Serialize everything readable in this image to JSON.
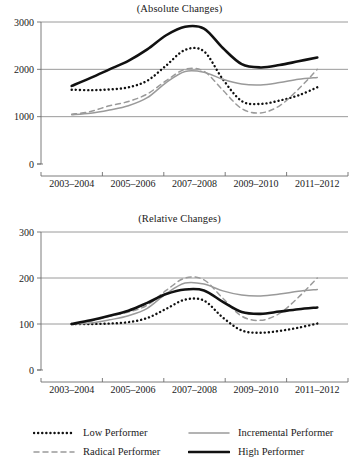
{
  "chart_data": [
    {
      "type": "line",
      "title": "(Absolute Changes)",
      "xlabel": "",
      "ylabel": "",
      "x": [
        "2003–2004",
        "2005–2006",
        "2007–2008",
        "2009–2010",
        "2011–2012"
      ],
      "xticklabels": [
        "2003–2004",
        "2005–2006",
        "2007–2008",
        "2009–2010",
        "2011–2012"
      ],
      "yticklabels": [
        "0",
        "1000",
        "2000",
        "3000"
      ],
      "ylim": [
        0,
        3000
      ],
      "yticks": [
        0,
        1000,
        2000,
        3000
      ],
      "grid": true,
      "legend_position": "below",
      "series": [
        {
          "name": "Low Performer",
          "style": "dotted",
          "color": "#111111",
          "values": [
            1570,
            1620,
            2410,
            1270,
            1620
          ],
          "points": [
            1570,
            1560,
            1575,
            1620,
            1760,
            2080,
            2410,
            2380,
            1790,
            1330,
            1270,
            1340,
            1450,
            1620
          ]
        },
        {
          "name": "Radical Performer",
          "style": "dashed",
          "color": "#9a9a9a",
          "values": [
            1050,
            1300,
            2000,
            1080,
            2000
          ],
          "points": [
            1050,
            1110,
            1230,
            1320,
            1480,
            1760,
            2000,
            1960,
            1560,
            1170,
            1080,
            1230,
            1580,
            2000
          ]
        },
        {
          "name": "Incremental Performer",
          "style": "solid",
          "color": "#9a9a9a",
          "values": [
            1040,
            1230,
            1960,
            1670,
            1830
          ],
          "points": [
            1040,
            1070,
            1140,
            1230,
            1400,
            1720,
            1955,
            1940,
            1790,
            1690,
            1670,
            1720,
            1790,
            1830
          ]
        },
        {
          "name": "High Performer",
          "style": "solid",
          "color": "#111111",
          "values": [
            1650,
            2060,
            2900,
            2040,
            2250
          ],
          "points": [
            1650,
            1820,
            2000,
            2180,
            2420,
            2720,
            2900,
            2860,
            2450,
            2110,
            2040,
            2090,
            2170,
            2250
          ]
        }
      ]
    },
    {
      "type": "line",
      "title": "(Relative Changes)",
      "xlabel": "",
      "ylabel": "",
      "x": [
        "2003–2004",
        "2005–2006",
        "2007–2008",
        "2009–2010",
        "2011–2012"
      ],
      "xticklabels": [
        "2003–2004",
        "2005–2006",
        "2007–2008",
        "2009–2010",
        "2011–2012"
      ],
      "yticklabels": [
        "0",
        "100",
        "200",
        "300"
      ],
      "ylim": [
        0,
        300
      ],
      "yticks": [
        0,
        100,
        200,
        300
      ],
      "grid": true,
      "legend_position": "below",
      "series": [
        {
          "name": "Low Performer",
          "style": "dotted",
          "color": "#111111",
          "values": [
            100,
            104,
            153,
            81,
            101
          ],
          "points": [
            100,
            100,
            101,
            104,
            113,
            133,
            153,
            151,
            114,
            86,
            81,
            85,
            92,
            101
          ]
        },
        {
          "name": "Radical Performer",
          "style": "dashed",
          "color": "#9a9a9a",
          "values": [
            100,
            124,
            200,
            108,
            200
          ],
          "points": [
            100,
            106,
            117,
            126,
            141,
            173,
            200,
            196,
            156,
            117,
            108,
            123,
            158,
            200
          ]
        },
        {
          "name": "Incremental Performer",
          "style": "solid",
          "color": "#9a9a9a",
          "values": [
            100,
            118,
            190,
            161,
            175
          ],
          "points": [
            100,
            102,
            109,
            118,
            134,
            166,
            189,
            187,
            172,
            163,
            161,
            165,
            171,
            175
          ]
        },
        {
          "name": "High Performer",
          "style": "solid",
          "color": "#111111",
          "values": [
            100,
            125,
            175,
            122,
            136
          ],
          "points": [
            100,
            108,
            118,
            129,
            146,
            165,
            175,
            173,
            148,
            126,
            122,
            127,
            132,
            136
          ]
        }
      ]
    }
  ],
  "panels": {
    "absolute": {
      "title": "(Absolute Changes)",
      "yticks": [
        "3000",
        "2000",
        "1000",
        "0"
      ],
      "xticks": [
        "2003–2004",
        "2005–2006",
        "2007–2008",
        "2009–2010",
        "2011–2012"
      ]
    },
    "relative": {
      "title": "(Relative Changes)",
      "yticks": [
        "300",
        "200",
        "100",
        "0"
      ],
      "xticks": [
        "2003–2004",
        "2005–2006",
        "2007–2008",
        "2009–2010",
        "2011–2012"
      ]
    }
  },
  "legend": {
    "items": [
      {
        "label": "Low Performer",
        "style": "dotted",
        "color": "#111111"
      },
      {
        "label": "Radical Performer",
        "style": "dashed",
        "color": "#9a9a9a"
      },
      {
        "label": "Incremental Performer",
        "style": "solid",
        "color": "#9a9a9a"
      },
      {
        "label": "High Performer",
        "style": "solid-bold",
        "color": "#111111"
      }
    ]
  },
  "colors": {
    "black": "#111111",
    "gray": "#9a9a9a",
    "grid": "#808080",
    "axis": "#6e6e6e"
  }
}
